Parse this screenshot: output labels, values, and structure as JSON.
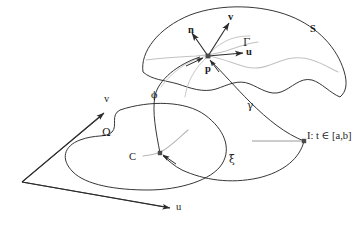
{
  "figure": {
    "type": "mathematical-diagram",
    "background_color": "#ffffff",
    "stroke_color": "#2b2b2b",
    "accent_curve_color": "#b3b3b3",
    "point_color": "#3a3a3a"
  },
  "labels": {
    "surface": "S",
    "domain": "Ω",
    "curve_on_surface": "Γ",
    "curve_in_domain": "C",
    "point": "p",
    "normal_vector": "n",
    "tangent_v": "v",
    "tangent_u": "u",
    "map_phi": "ϕ",
    "map_gamma": "γ",
    "map_xi": "ξ",
    "axis_u": "u",
    "axis_v": "v",
    "interval": "I: t ∈ [a,b]"
  },
  "elements": {
    "surface_patch": "curved-surface-patch",
    "domain_region": "kidney-shaped-planar-region",
    "parameter_plane": "parallelogram-uv-plane",
    "interval_segment": "horizontal-line-segment",
    "point_p": "marked-point-on-surface",
    "point_c": "marked-point-in-domain",
    "point_t": "marked-point-on-interval"
  },
  "vectors": {
    "n": {
      "from": [
        208,
        56
      ],
      "to": [
        192,
        32
      ],
      "label": "n"
    },
    "v": {
      "from": [
        208,
        56
      ],
      "to": [
        230,
        22
      ],
      "label": "v"
    },
    "u": {
      "from": [
        208,
        56
      ],
      "to": [
        245,
        53
      ],
      "label": "u"
    }
  },
  "axes": {
    "origin": [
      22,
      182
    ],
    "v_tip": [
      106,
      112
    ],
    "u_tip": [
      172,
      209
    ]
  }
}
